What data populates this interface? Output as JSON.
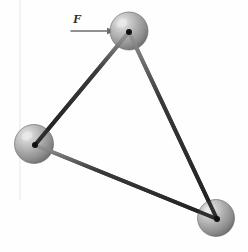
{
  "figure": {
    "name": "three-sphere-rigid-triangle-on-surface",
    "background_color": "#fefefe",
    "width": 248,
    "height": 252
  },
  "labels": {
    "force": "F"
  },
  "force_arrow": {
    "name": "force-arrow",
    "direction": "right",
    "x1": 71,
    "y1": 31,
    "x2": 116,
    "y2": 31,
    "color": "#6d6d6d",
    "head_length": 9,
    "head_half_width": 3.2
  },
  "surface": {
    "name": "ground-surface-line",
    "x1": 57,
    "x2": 197,
    "y": 49,
    "color": "#8e8e8e",
    "thickness": 2.2
  },
  "artifact_line": {
    "name": "scan-artifact-line",
    "x": 20,
    "y1": 0,
    "y2": 200,
    "color": "#f3f3f3"
  },
  "spheres": [
    {
      "id": "top",
      "name": "sphere-top",
      "cx": 129,
      "cy": 31,
      "r": 19,
      "highlight_dx": -7,
      "highlight_dy": -8
    },
    {
      "id": "left",
      "name": "sphere-left",
      "cx": 34,
      "cy": 144,
      "r": 19.5,
      "highlight_dx": -7,
      "highlight_dy": -8
    },
    {
      "id": "bottom-right",
      "name": "sphere-bottom-right",
      "cx": 216,
      "cy": 218,
      "r": 18.5,
      "highlight_dx": -7,
      "highlight_dy": -8
    }
  ],
  "joints": [
    {
      "id": "joint-top",
      "name": "joint-top",
      "cx": 129,
      "cy": 32,
      "r": 3.0
    },
    {
      "id": "joint-left",
      "name": "joint-left",
      "cx": 35,
      "cy": 145,
      "r": 3.0
    },
    {
      "id": "joint-bottom-right",
      "name": "joint-bottom-right",
      "cx": 217,
      "cy": 219,
      "r": 3.0
    }
  ],
  "rods": [
    {
      "id": "rod-top-left",
      "name": "rod-top-to-left",
      "x1": 129,
      "y1": 32,
      "x2": 35,
      "y2": 145,
      "thickness": 4.0
    },
    {
      "id": "rod-top-right",
      "name": "rod-top-to-bottom-right",
      "x1": 129,
      "y1": 32,
      "x2": 217,
      "y2": 219,
      "thickness": 4.0
    },
    {
      "id": "rod-left-right",
      "name": "rod-left-to-bottom-right",
      "x1": 35,
      "y1": 145,
      "x2": 217,
      "y2": 219,
      "thickness": 4.0
    }
  ],
  "colors": {
    "sphere_light": "#d8d8d8",
    "sphere_mid": "#a8a8a8",
    "sphere_dark": "#6f6f6f",
    "sphere_edge": "#5c5c5c",
    "rod_light": "#8c8c8c",
    "rod_dark": "#2f2f2f",
    "joint": "#101010",
    "surface": "#8e8e8e",
    "arrow": "#6d6d6d",
    "label_text": "#2a2a2a"
  }
}
